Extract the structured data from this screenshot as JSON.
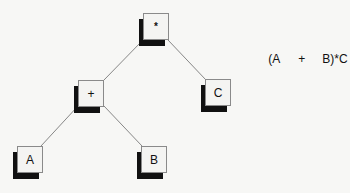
{
  "diagram": {
    "type": "expression-tree",
    "expression": {
      "parts": [
        "(A",
        "+",
        "B)*C"
      ]
    },
    "nodes": [
      {
        "id": "mul",
        "label": "*"
      },
      {
        "id": "plus",
        "label": "+"
      },
      {
        "id": "c",
        "label": "C"
      },
      {
        "id": "a",
        "label": "A"
      },
      {
        "id": "b",
        "label": "B"
      }
    ],
    "edges": [
      {
        "from": "*",
        "to": "+"
      },
      {
        "from": "*",
        "to": "C"
      },
      {
        "from": "+",
        "to": "A"
      },
      {
        "from": "+",
        "to": "B"
      }
    ],
    "colors": {
      "background": "#f7f7f5",
      "shadow": "#111111",
      "border": "#8a8a8a",
      "edge": "#6a6a6a"
    }
  }
}
